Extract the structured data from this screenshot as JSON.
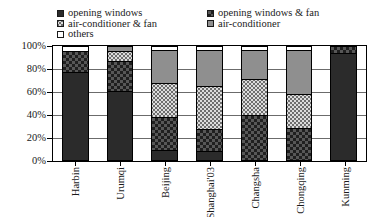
{
  "legend": {
    "entries": [
      {
        "label": "opening windows",
        "key": "opening_windows",
        "swatch": "solid-dark-swatch",
        "color": "#2b2b2b"
      },
      {
        "label": "opening windows & fan",
        "key": "opening_windows_fan",
        "swatch": "checkered-dark-swatch",
        "color": "#575757"
      },
      {
        "label": "air-conditioner & fan",
        "key": "air_conditioner_fan",
        "swatch": "speckled-light-swatch",
        "color": "#dcdcdc"
      },
      {
        "label": "air-conditioner",
        "key": "air_conditioner",
        "swatch": "solid-gray-swatch",
        "color": "#8f8f8f"
      },
      {
        "label": "others",
        "key": "others",
        "swatch": "white-swatch",
        "color": "#ffffff"
      }
    ]
  },
  "chart_data": {
    "type": "bar",
    "title": "",
    "xlabel": "",
    "ylabel": "",
    "stacked": true,
    "normalized_percent": true,
    "ylim": [
      0,
      100
    ],
    "yticks": [
      "0%",
      "20%",
      "40%",
      "60%",
      "80%",
      "100%"
    ],
    "ytick_values": [
      0,
      20,
      40,
      60,
      80,
      100
    ],
    "grid": true,
    "legend_position": "top",
    "categories": [
      "Harbin",
      "Urumqi",
      "Beijing",
      "Shanghai'03",
      "Changsha",
      "Chongqing",
      "Kunming"
    ],
    "series": [
      {
        "name": "opening windows",
        "values": [
          78,
          62,
          8,
          7,
          0,
          0,
          95
        ]
      },
      {
        "name": "opening windows & fan",
        "values": [
          18,
          26,
          30,
          20,
          40,
          28,
          5
        ]
      },
      {
        "name": "air-conditioner & fan",
        "values": [
          0,
          8,
          30,
          38,
          32,
          30,
          0
        ]
      },
      {
        "name": "air-conditioner",
        "values": [
          0,
          4,
          29,
          32,
          25,
          39,
          0
        ]
      },
      {
        "name": "others",
        "values": [
          4,
          0,
          3,
          3,
          3,
          3,
          0
        ]
      }
    ]
  }
}
